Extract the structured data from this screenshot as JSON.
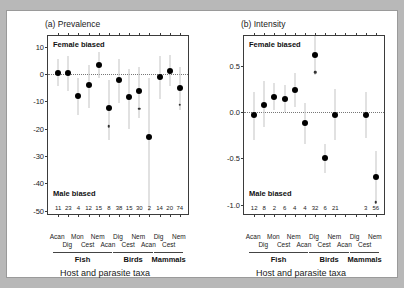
{
  "figure": {
    "background_color": "#b8b8b8",
    "page_color": "#ffffff"
  },
  "chart_data": [
    {
      "type": "scatter",
      "panel": "a",
      "title": "(a) Prevalence",
      "xlabel": "Host and parasite taxa",
      "ylabel": "Mean difference +/- SE",
      "ylim": [
        -52,
        14
      ],
      "yticks": [
        10,
        0,
        -10,
        -20,
        -30,
        -40,
        -50
      ],
      "ytick_labels": [
        "10",
        "0",
        "-10",
        "-20",
        "-30",
        "-40",
        "-50"
      ],
      "grid": false,
      "zero_reference_line": 0,
      "annotations": {
        "top": "Female biased",
        "bottom": "Male biased"
      },
      "categories": [
        "Acan",
        "Mon",
        "Nem",
        "Dig",
        "Nem",
        "Dig",
        "Nem",
        "Dig",
        "Cest",
        "Acan",
        "Cest",
        "Acan",
        "Cest"
      ],
      "category_rows": {
        "row1": [
          "Acan",
          "",
          "Mon",
          "",
          "Nem",
          "",
          "Dig",
          "",
          "Nem",
          "",
          "Dig",
          "",
          "Nem"
        ],
        "row2": [
          "",
          "Dig",
          "",
          "Cest",
          "",
          "Acan",
          "",
          "Cest",
          "",
          "Acan",
          "",
          "Cest",
          ""
        ]
      },
      "groups": [
        {
          "label": "Fish",
          "from_index": 0,
          "to_index": 5
        },
        {
          "label": "Birds",
          "from_index": 6,
          "to_index": 9
        },
        {
          "label": "Mammals",
          "from_index": 10,
          "to_index": 12
        }
      ],
      "sample_sizes": [
        11,
        23,
        4,
        12,
        15,
        8,
        38,
        15,
        30,
        2,
        14,
        20,
        74
      ],
      "values": [
        0.5,
        0.5,
        -8.0,
        -4.0,
        3.2,
        -12.3,
        -2.1,
        -8.2,
        -6.3,
        -23.2,
        -1.1,
        1.3,
        -5.0
      ],
      "err_low": [
        -4.5,
        -6.0,
        -15.0,
        -12.5,
        -1.5,
        -24.0,
        -10.5,
        -20.0,
        -16.0,
        -50.0,
        -9.0,
        -4.5,
        -13.0
      ],
      "err_high": [
        5.5,
        6.5,
        -1.5,
        3.5,
        8.0,
        -2.0,
        5.5,
        2.0,
        2.5,
        -1.5,
        6.5,
        7.0,
        2.5
      ],
      "significance_markers": [
        {
          "index": 5,
          "value": -19.0
        },
        {
          "index": 8,
          "value": -12.6
        },
        {
          "index": 12,
          "value": -11.2
        }
      ]
    },
    {
      "type": "scatter",
      "panel": "b",
      "title": "(b) Intensity",
      "xlabel": "Host and parasite taxa",
      "ylabel": "Mean difference +/- SE",
      "ylim": [
        -1.12,
        0.82
      ],
      "yticks": [
        0.5,
        0.0,
        -0.5,
        -1.0
      ],
      "ytick_labels": [
        "0.5",
        "0.0",
        "-0.5",
        "-1.0"
      ],
      "grid": false,
      "zero_reference_line": 0,
      "annotations": {
        "top": "Female biased",
        "bottom": "Male biased"
      },
      "categories": [
        "Acan",
        "Mon",
        "Nem",
        "Dig",
        "Nem",
        "Dig",
        "Nem",
        "Dig",
        "Cest",
        "Acan",
        "Cest",
        "Acan",
        "Cest"
      ],
      "category_rows": {
        "row1": [
          "Acan",
          "",
          "Mon",
          "",
          "Nem",
          "",
          "Dig",
          "",
          "Nem",
          "",
          "Dig",
          "",
          "Nem"
        ],
        "row2": [
          "",
          "Dig",
          "",
          "Cest",
          "",
          "Acan",
          "",
          "Cest",
          "",
          "Acan",
          "",
          "Cest",
          ""
        ]
      },
      "groups": [
        {
          "label": "Fish",
          "from_index": 0,
          "to_index": 5
        },
        {
          "label": "Birds",
          "from_index": 6,
          "to_index": 9
        },
        {
          "label": "Mammals",
          "from_index": 10,
          "to_index": 12
        }
      ],
      "sample_sizes": [
        12,
        8,
        2,
        6,
        4,
        4,
        32,
        6,
        21,
        null,
        null,
        3,
        56
      ],
      "values": [
        -0.03,
        0.08,
        0.16,
        0.14,
        0.24,
        -0.12,
        0.62,
        -0.5,
        -0.03,
        null,
        null,
        -0.03,
        -0.7
      ],
      "err_low": [
        -0.3,
        -0.16,
        0.02,
        0.0,
        0.06,
        -0.34,
        0.4,
        -0.66,
        -0.3,
        null,
        null,
        -0.28,
        -0.98
      ],
      "err_high": [
        0.22,
        0.33,
        0.31,
        0.29,
        0.42,
        0.1,
        0.82,
        -0.34,
        0.25,
        null,
        null,
        0.22,
        -0.42
      ],
      "significance_markers": [
        {
          "index": 6,
          "value": 0.43
        },
        {
          "index": 12,
          "value": -0.97
        }
      ]
    }
  ]
}
